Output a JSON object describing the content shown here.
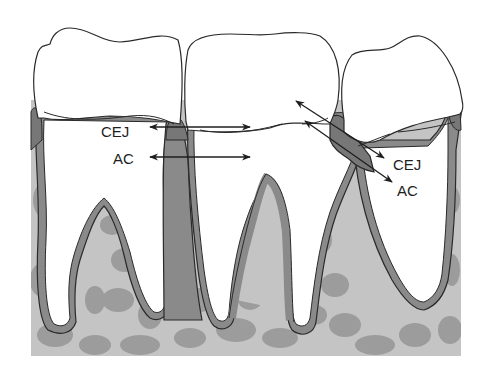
{
  "diagram": {
    "labels": {
      "left_cej": "CEJ",
      "left_ac": "AC",
      "right_cej": "CEJ",
      "right_ac": "AC"
    },
    "colors": {
      "background": "#ffffff",
      "outline": "#2a2a2a",
      "cortical_bone": "#8a8a8a",
      "cancellous_bone": "#c4c4c4",
      "trabecular_spots": "#9c9c9c",
      "crown_fill": "#ffffff",
      "arrow": "#1e1e1e"
    }
  }
}
